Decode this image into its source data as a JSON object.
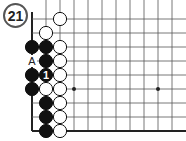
{
  "diagram": {
    "number": "21",
    "grid": {
      "origin_x": 32,
      "origin_y": 5,
      "spacing": 14,
      "cols": 11,
      "rows": 10,
      "left_edge": true,
      "bottom_edge": true,
      "line_color": "#555555",
      "edge_color": "#222222"
    },
    "star_points": [
      [
        3,
        6
      ],
      [
        9,
        6
      ]
    ],
    "stones": [
      {
        "col": 2,
        "row": 1,
        "color": "white"
      },
      {
        "col": 1,
        "row": 2,
        "color": "white"
      },
      {
        "col": 0,
        "row": 3,
        "color": "black"
      },
      {
        "col": 1,
        "row": 3,
        "color": "black"
      },
      {
        "col": 2,
        "row": 3,
        "color": "white"
      },
      {
        "col": 1,
        "row": 4,
        "color": "black"
      },
      {
        "col": 2,
        "row": 4,
        "color": "white"
      },
      {
        "col": 0,
        "row": 5,
        "color": "black"
      },
      {
        "col": 1,
        "row": 5,
        "color": "black",
        "label": "1"
      },
      {
        "col": 2,
        "row": 5,
        "color": "white"
      },
      {
        "col": 0,
        "row": 6,
        "color": "black"
      },
      {
        "col": 1,
        "row": 6,
        "color": "white"
      },
      {
        "col": 2,
        "row": 6,
        "color": "white"
      },
      {
        "col": 1,
        "row": 7,
        "color": "black"
      },
      {
        "col": 2,
        "row": 7,
        "color": "white"
      },
      {
        "col": 1,
        "row": 8,
        "color": "black"
      },
      {
        "col": 2,
        "row": 8,
        "color": "white"
      },
      {
        "col": 1,
        "row": 9,
        "color": "black"
      },
      {
        "col": 2,
        "row": 9,
        "color": "white"
      }
    ],
    "markers": [
      {
        "col": 0,
        "row": 4,
        "label": "A"
      }
    ]
  }
}
